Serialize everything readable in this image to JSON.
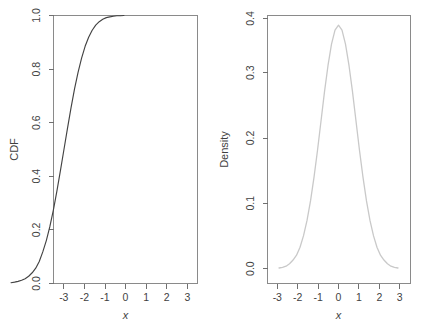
{
  "figure": {
    "background_color": "#ffffff",
    "panel_count": 2,
    "layout": "1x2 side-by-side"
  },
  "chart_data": [
    {
      "type": "line",
      "title": "",
      "xlabel": "x",
      "ylabel": "CDF",
      "xlim": [
        -3.5,
        3.5
      ],
      "ylim": [
        0.0,
        1.0
      ],
      "xticks": [
        -3,
        -2,
        -1,
        0,
        1,
        2,
        3
      ],
      "xtick_labels": [
        "-3",
        "-2",
        "-1",
        "0",
        "1",
        "2",
        "3"
      ],
      "yticks": [
        0.0,
        0.2,
        0.4,
        0.6,
        0.8,
        1.0
      ],
      "ytick_labels": [
        "0.0",
        "0.2",
        "0.4",
        "0.6",
        "0.8",
        "1.0"
      ],
      "grid": false,
      "legend": "none",
      "series": [
        {
          "name": "Empirical CDF",
          "color": "#434343",
          "linestyle": "solid",
          "x": [
            -3.0,
            -2.8,
            -2.6,
            -2.4,
            -2.2,
            -2.0,
            -1.8,
            -1.6,
            -1.4,
            -1.2,
            -1.0,
            -0.8,
            -0.6,
            -0.4,
            -0.2,
            0.0,
            0.2,
            0.4,
            0.6,
            0.8,
            1.0,
            1.2,
            1.4,
            1.6,
            1.8,
            2.0,
            2.2,
            2.4,
            2.6,
            2.8,
            3.0,
            3.2,
            3.4
          ],
          "y": [
            0.003,
            0.005,
            0.008,
            0.012,
            0.018,
            0.027,
            0.04,
            0.057,
            0.082,
            0.118,
            0.16,
            0.212,
            0.274,
            0.345,
            0.421,
            0.5,
            0.579,
            0.655,
            0.726,
            0.788,
            0.841,
            0.885,
            0.919,
            0.945,
            0.964,
            0.977,
            0.986,
            0.992,
            0.995,
            0.997,
            0.999,
            0.999,
            1.0
          ]
        }
      ]
    },
    {
      "type": "line",
      "title": "",
      "xlabel": "x",
      "ylabel": "Density",
      "xlim": [
        -3.5,
        3.5
      ],
      "ylim": [
        0.0,
        0.41
      ],
      "xticks": [
        -3,
        -2,
        -1,
        0,
        1,
        2,
        3
      ],
      "xtick_labels": [
        "-3",
        "-2",
        "-1",
        "0",
        "1",
        "2",
        "3"
      ],
      "yticks": [
        0.0,
        0.1,
        0.2,
        0.3,
        0.4
      ],
      "ytick_labels": [
        "0.0",
        "0.1",
        "0.2",
        "0.3",
        "0.4"
      ],
      "grid": false,
      "legend": "none",
      "series": [
        {
          "name": "Density estimate",
          "color": "#c9c9c9",
          "linestyle": "dotted",
          "x": [
            -3.4,
            -3.2,
            -3.0,
            -2.8,
            -2.6,
            -2.4,
            -2.2,
            -2.0,
            -1.8,
            -1.6,
            -1.4,
            -1.2,
            -1.0,
            -0.8,
            -0.6,
            -0.4,
            -0.2,
            0.0,
            0.2,
            0.4,
            0.6,
            0.8,
            1.0,
            1.2,
            1.4,
            1.6,
            1.8,
            2.0,
            2.2,
            2.4,
            2.6,
            2.8,
            3.0,
            3.2,
            3.4
          ],
          "y": [
            0.001,
            0.002,
            0.004,
            0.008,
            0.014,
            0.022,
            0.035,
            0.054,
            0.079,
            0.111,
            0.15,
            0.194,
            0.242,
            0.29,
            0.333,
            0.368,
            0.391,
            0.399,
            0.391,
            0.368,
            0.333,
            0.29,
            0.242,
            0.194,
            0.15,
            0.111,
            0.079,
            0.054,
            0.035,
            0.022,
            0.014,
            0.008,
            0.004,
            0.002,
            0.001
          ]
        }
      ]
    }
  ],
  "panels": {
    "cdf": {
      "name": "CDF panel",
      "ylabel": "CDF",
      "xlabel": "x",
      "ytick_labels": [
        "0.0",
        "0.2",
        "0.4",
        "0.6",
        "0.8",
        "1.0"
      ],
      "xtick_labels": [
        "-3",
        "-2",
        "-1",
        "0",
        "1",
        "2",
        "3"
      ]
    },
    "density": {
      "name": "Density panel",
      "ylabel": "Density",
      "xlabel": "x",
      "ytick_labels": [
        "0.0",
        "0.1",
        "0.2",
        "0.3",
        "0.4"
      ],
      "xtick_labels": [
        "-3",
        "-2",
        "-1",
        "0",
        "1",
        "2",
        "3"
      ]
    }
  },
  "colors": {
    "cdf_curve": "#434343",
    "density_curve": "#c9c9c9",
    "axis": "#707070",
    "box": "#8a8a8a",
    "text": "#3f3f3f",
    "background": "#ffffff"
  }
}
